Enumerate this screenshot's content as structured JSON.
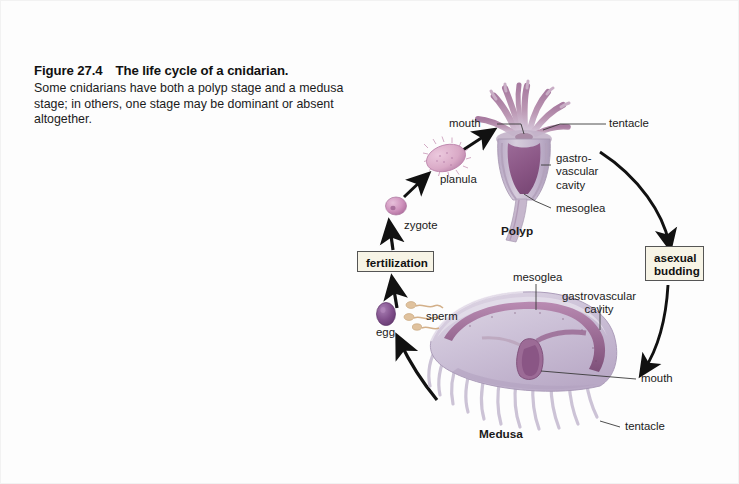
{
  "figure": {
    "number": "Figure 27.4",
    "title": "The life cycle of a cnidarian.",
    "description": "Some cnidarians have both a polyp stage and a medusa stage; in others, one stage may be dominant or absent altogether."
  },
  "process_labels": {
    "fertilization": "fertilization",
    "asexual_budding": "asexual\nbudding",
    "asexual_budding_line1": "asexual",
    "asexual_budding_line2": "budding"
  },
  "stages": {
    "polyp": "Polyp",
    "medusa": "Medusa",
    "planula": "planula",
    "zygote": "zygote",
    "egg": "egg",
    "sperm": "sperm"
  },
  "polyp_labels": {
    "mouth": "mouth",
    "tentacle": "tentacle",
    "gastrovascular_cavity_line1": "gastro-",
    "gastrovascular_cavity_line2": "vascular",
    "gastrovascular_cavity_line3": "cavity",
    "mesoglea": "mesoglea"
  },
  "medusa_labels": {
    "mesoglea": "mesoglea",
    "gastrovascular_cavity_line1": "gastrovascular",
    "gastrovascular_cavity_line2": "cavity",
    "mouth": "mouth",
    "tentacle": "tentacle"
  },
  "colors": {
    "background": "#fdfdfd",
    "text": "#1a1a1a",
    "box_fill": "#f7f4e6",
    "box_border": "#555555",
    "arrow": "#111111",
    "polyp_tentacle": "#b089a6",
    "polyp_body": "#c9bcd2",
    "polyp_cavity": "#8f5f8c",
    "medusa_bell": "#cfc5d8",
    "medusa_canal": "#9a6b94",
    "zygote": "#c98fb8",
    "planula": "#d9a9c6",
    "egg": "#7a4a86",
    "sperm": "#d8b894"
  }
}
